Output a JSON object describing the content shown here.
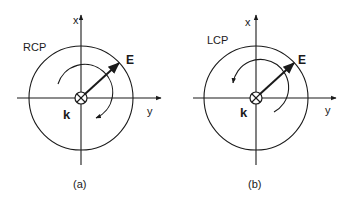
{
  "panels": [
    {
      "id": "a",
      "caption": "(a)",
      "polarization_label": "RCP",
      "axis_x_label": "x",
      "axis_y_label": "y",
      "field_label": "E",
      "wavevector_label": "k",
      "rotation": "clockwise"
    },
    {
      "id": "b",
      "caption": "(b)",
      "polarization_label": "LCP",
      "axis_x_label": "x",
      "axis_y_label": "y",
      "field_label": "E",
      "wavevector_label": "k",
      "rotation": "counterclockwise"
    }
  ],
  "colors": {
    "ink": "#1a1a1a",
    "background": "#ffffff"
  }
}
